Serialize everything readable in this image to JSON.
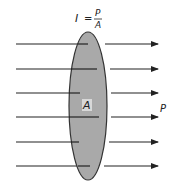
{
  "diagram": {
    "formula": {
      "lhs": "I",
      "eq": "=",
      "numerator": "P",
      "denominator": "A"
    },
    "area_label": "A",
    "power_label": "P",
    "rows_y": [
      44,
      69,
      93,
      117,
      142,
      166
    ],
    "colors": {
      "surface_fill": "#a9a9a9",
      "outline": "#333333",
      "ray": "#222222"
    }
  }
}
